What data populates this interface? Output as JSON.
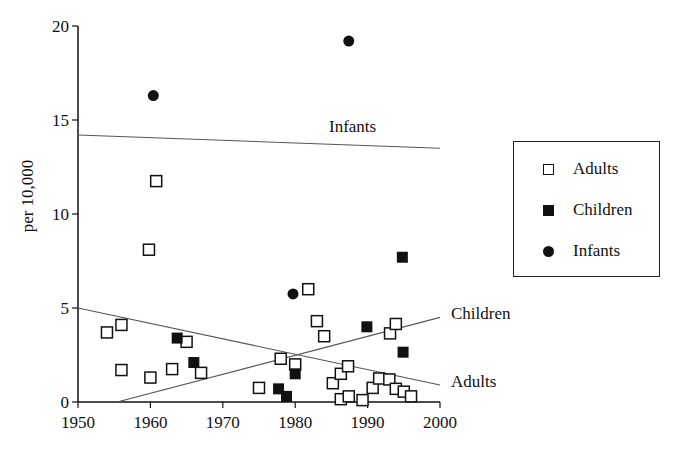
{
  "chart_data": {
    "type": "scatter",
    "title": "",
    "xlabel": "",
    "ylabel": "per 10,000",
    "xlim": [
      1950,
      2000
    ],
    "ylim": [
      0,
      20
    ],
    "x_ticks": [
      1950,
      1960,
      1970,
      1980,
      1990,
      2000
    ],
    "y_ticks": [
      0,
      5,
      10,
      15,
      20
    ],
    "grid": false,
    "legend_position": "right",
    "series": [
      {
        "name": "Adults",
        "marker": "open-square",
        "points": [
          [
            1954.0,
            3.7
          ],
          [
            1956.0,
            4.1
          ],
          [
            1956.0,
            1.7
          ],
          [
            1959.8,
            8.1
          ],
          [
            1960.8,
            11.75
          ],
          [
            1960.0,
            1.3
          ],
          [
            1963.0,
            1.75
          ],
          [
            1965.0,
            3.2
          ],
          [
            1967.0,
            1.55
          ],
          [
            1975.0,
            0.75
          ],
          [
            1978.0,
            2.3
          ],
          [
            1980.0,
            2.0
          ],
          [
            1981.8,
            6.0
          ],
          [
            1983.0,
            4.3
          ],
          [
            1984.0,
            3.5
          ],
          [
            1985.2,
            1.0
          ],
          [
            1986.3,
            1.5
          ],
          [
            1987.3,
            1.9
          ],
          [
            1986.3,
            0.15
          ],
          [
            1987.4,
            0.3
          ],
          [
            1989.3,
            0.1
          ],
          [
            1990.7,
            0.75
          ],
          [
            1991.6,
            1.25
          ],
          [
            1993.0,
            1.2
          ],
          [
            1993.1,
            3.65
          ],
          [
            1993.9,
            4.15
          ],
          [
            1993.9,
            0.7
          ],
          [
            1995.0,
            0.55
          ],
          [
            1996.0,
            0.3
          ]
        ],
        "trend_line": [
          [
            1950,
            5.0
          ],
          [
            2000,
            0.9
          ]
        ],
        "trend_label": "Adults"
      },
      {
        "name": "Children",
        "marker": "filled-square",
        "points": [
          [
            1963.7,
            3.4
          ],
          [
            1966.0,
            2.1
          ],
          [
            1977.7,
            0.7
          ],
          [
            1978.8,
            0.3
          ],
          [
            1980.0,
            1.5
          ],
          [
            1989.9,
            4.0
          ],
          [
            1994.9,
            2.65
          ],
          [
            1994.8,
            7.7
          ]
        ],
        "trend_line": [
          [
            1955.4,
            0.0
          ],
          [
            2000,
            4.5
          ]
        ],
        "trend_label": "Children"
      },
      {
        "name": "Infants",
        "marker": "filled-circle",
        "points": [
          [
            1960.4,
            16.3
          ],
          [
            1979.7,
            5.75
          ],
          [
            1987.4,
            19.2
          ]
        ],
        "trend_line": [
          [
            1950,
            14.2
          ],
          [
            2000,
            13.5
          ]
        ],
        "trend_label": "Infants"
      }
    ]
  },
  "legend": {
    "items": [
      {
        "label": "Adults",
        "symbol": "open-square"
      },
      {
        "label": "Children",
        "symbol": "filled-square"
      },
      {
        "label": "Infants",
        "symbol": "filled-circle"
      }
    ]
  },
  "axis": {
    "ylabel": "per 10,000"
  },
  "colors": {
    "ink": "#111111",
    "trend": "#555555",
    "background": "#ffffff"
  }
}
